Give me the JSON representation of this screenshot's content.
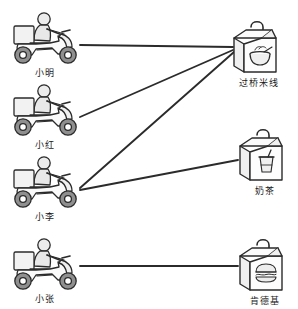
{
  "diagram": {
    "title": "",
    "type": "bipartite-matching",
    "stroke_color": "#2b2b2b",
    "fill_light": "#f2f2f2",
    "fill_mid": "#d8d8d8",
    "fill_dark": "#8f8f8f",
    "background": "#ffffff",
    "left_group": {
      "name": "riders",
      "icon": "scooter-rider-icon",
      "items": [
        {
          "id": "xiaoming",
          "label": "小明",
          "x": 6,
          "y": 10
        },
        {
          "id": "xiaohong",
          "label": "小红",
          "x": 6,
          "y": 78
        },
        {
          "id": "xiaoli",
          "label": "小李",
          "x": 6,
          "y": 150
        },
        {
          "id": "xiaozhang",
          "label": "小张",
          "x": 6,
          "y": 232
        }
      ]
    },
    "right_group": {
      "name": "orders",
      "icon": "takeout-bag-icon",
      "items": [
        {
          "id": "guoqiaomixian",
          "label": "过桥米线",
          "glyph": "noodle-bowl-icon",
          "x": 228,
          "y": 16
        },
        {
          "id": "naicha",
          "label": "奶茶",
          "glyph": "drink-cup-icon",
          "x": 234,
          "y": 124
        },
        {
          "id": "kendeji",
          "label": "肯德基",
          "glyph": "burger-icon",
          "x": 234,
          "y": 234
        }
      ]
    },
    "edges": [
      {
        "id": "e1",
        "from": "xiaoming",
        "to": "guoqiaomixian",
        "x1": 80,
        "y1": 45,
        "x2": 233,
        "y2": 47
      },
      {
        "id": "e2",
        "from": "xiaohong",
        "to": "guoqiaomixian",
        "x1": 80,
        "y1": 117,
        "x2": 233,
        "y2": 50
      },
      {
        "id": "e3",
        "from": "xiaoli",
        "to": "guoqiaomixian",
        "x1": 80,
        "y1": 188,
        "x2": 234,
        "y2": 52
      },
      {
        "id": "e4",
        "from": "xiaoli",
        "to": "naicha",
        "x1": 80,
        "y1": 190,
        "x2": 238,
        "y2": 160
      },
      {
        "id": "e5",
        "from": "xiaozhang",
        "to": "kendeji",
        "x1": 80,
        "y1": 266,
        "x2": 238,
        "y2": 266
      }
    ]
  }
}
